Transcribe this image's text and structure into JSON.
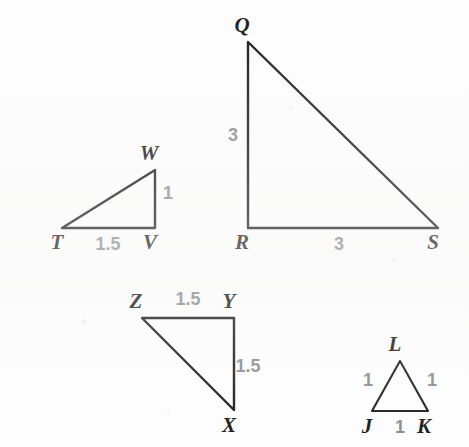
{
  "figure": {
    "background_color": "#fdfdfd",
    "line_color": "#1b1b1b",
    "vertex_label_color": "#1b1b1b",
    "measure_label_color": "#8d8d8d"
  },
  "triangles": [
    {
      "id": "TVW",
      "name": "triangle-tvw",
      "vertices": [
        {
          "label": "T",
          "x": 62,
          "y": 228,
          "label_x": 57,
          "label_y": 249
        },
        {
          "label": "V",
          "x": 155,
          "y": 228,
          "label_x": 150,
          "label_y": 249
        },
        {
          "label": "W",
          "x": 155,
          "y": 170,
          "label_x": 149,
          "label_y": 160
        }
      ],
      "path": "M62,228 L155,228 L155,170 Z",
      "measures": [
        {
          "side": "TV",
          "value": "1.5",
          "x": 108,
          "y": 250
        },
        {
          "side": "VW",
          "value": "1",
          "x": 168,
          "y": 199
        }
      ]
    },
    {
      "id": "QRS",
      "name": "triangle-qrs",
      "vertices": [
        {
          "label": "Q",
          "x": 248,
          "y": 42,
          "label_x": 242,
          "label_y": 32
        },
        {
          "label": "R",
          "x": 248,
          "y": 228,
          "label_x": 242,
          "label_y": 249
        },
        {
          "label": "S",
          "x": 438,
          "y": 228,
          "label_x": 433,
          "label_y": 249
        }
      ],
      "path": "M248,42 L248,228 L438,228 Z",
      "measures": [
        {
          "side": "QR",
          "value": "3",
          "x": 233,
          "y": 141
        },
        {
          "side": "RS",
          "value": "3",
          "x": 339,
          "y": 250
        }
      ]
    },
    {
      "id": "XYZ",
      "name": "triangle-xyz",
      "vertices": [
        {
          "label": "Z",
          "x": 142,
          "y": 318,
          "label_x": 136,
          "label_y": 308
        },
        {
          "label": "Y",
          "x": 234,
          "y": 318,
          "label_x": 229,
          "label_y": 308
        },
        {
          "label": "X",
          "x": 234,
          "y": 410,
          "label_x": 229,
          "label_y": 432
        }
      ],
      "path": "M142,318 L234,318 L234,410 Z",
      "measures": [
        {
          "side": "ZY",
          "value": "1.5",
          "x": 188,
          "y": 305
        },
        {
          "side": "YX",
          "value": "1.5",
          "x": 248,
          "y": 372
        }
      ]
    },
    {
      "id": "JKL",
      "name": "triangle-jkl",
      "vertices": [
        {
          "label": "L",
          "x": 400,
          "y": 361,
          "label_x": 395,
          "label_y": 351
        },
        {
          "label": "J",
          "x": 372,
          "y": 411,
          "label_x": 367,
          "label_y": 433
        },
        {
          "label": "K",
          "x": 428,
          "y": 411,
          "label_x": 424,
          "label_y": 433
        }
      ],
      "path": "M400,361 L372,411 L428,411 Z",
      "measures": [
        {
          "side": "JL",
          "value": "1",
          "x": 368,
          "y": 386
        },
        {
          "side": "LK",
          "value": "1",
          "x": 432,
          "y": 386
        },
        {
          "side": "JK",
          "value": "1",
          "x": 400,
          "y": 433
        }
      ]
    }
  ]
}
